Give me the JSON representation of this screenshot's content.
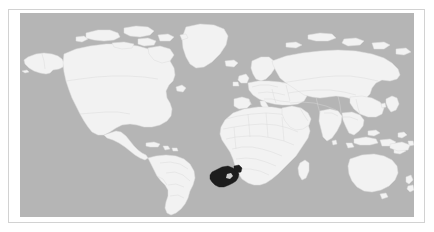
{
  "figure": {
    "type": "world-locator-map",
    "projection": "equirectangular",
    "title": "",
    "caption": "",
    "width_px": 434,
    "height_px": 232
  },
  "frame": {
    "has_border": true,
    "border_color": "#d2d2d2",
    "mat_color": "#ffffff"
  },
  "map": {
    "ocean_color": "#b5b5b5",
    "land_color": "#f2f2f2",
    "border_color": "#dcdcdc",
    "highlight_color": "#1d1d1d",
    "highlighted_region": "South Africa",
    "highlighted_region_label": "",
    "legend": [],
    "labels": []
  },
  "regions": [
    {
      "name": "north-america",
      "highlighted": false
    },
    {
      "name": "south-america",
      "highlighted": false
    },
    {
      "name": "greenland",
      "highlighted": false
    },
    {
      "name": "europe",
      "highlighted": false
    },
    {
      "name": "africa",
      "highlighted": false
    },
    {
      "name": "asia",
      "highlighted": false
    },
    {
      "name": "australia",
      "highlighted": false
    },
    {
      "name": "new-zealand",
      "highlighted": false
    },
    {
      "name": "south-africa",
      "highlighted": true
    }
  ]
}
